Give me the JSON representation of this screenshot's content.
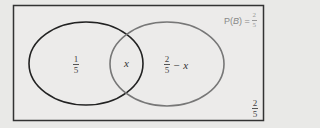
{
  "diagram": {
    "type": "venn",
    "universe_label": "2/5",
    "universe_num": "2",
    "universe_den": "5",
    "pb_label": {
      "prefix": "P(",
      "var": "B",
      "suffix": ") =",
      "num": "2",
      "den": "5"
    },
    "set_a": {
      "only_num": "1",
      "only_den": "5",
      "stroke": "#222222"
    },
    "set_b": {
      "only_num": "2",
      "only_den": "5",
      "only_suffix": "− x",
      "stroke": "#777777"
    },
    "intersection": "x",
    "colors": {
      "background": "#e9e9e7",
      "frame": "#333333"
    }
  }
}
